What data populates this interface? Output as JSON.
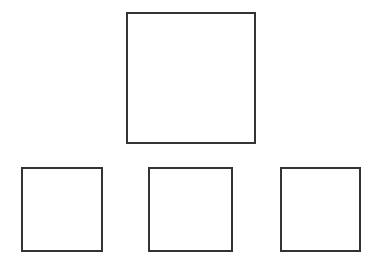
{
  "diagram": {
    "type": "hierarchy",
    "stroke_color": "#333333",
    "background": "#ffffff",
    "nodes": [
      {
        "id": "top",
        "label": "",
        "x": 126,
        "y": 12,
        "w": 130,
        "h": 132
      },
      {
        "id": "bottom-left",
        "label": "",
        "x": 21,
        "y": 167,
        "w": 82,
        "h": 85
      },
      {
        "id": "bottom-middle",
        "label": "",
        "x": 148,
        "y": 167,
        "w": 85,
        "h": 85
      },
      {
        "id": "bottom-right",
        "label": "",
        "x": 280,
        "y": 167,
        "w": 81,
        "h": 85
      }
    ]
  }
}
